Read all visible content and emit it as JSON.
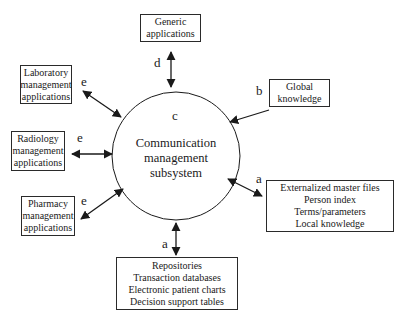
{
  "center": {
    "label": "c",
    "lines": [
      "Communication",
      "management",
      "subsystem"
    ]
  },
  "nodes": {
    "generic": {
      "lines": [
        "Generic",
        "applications"
      ],
      "edge_label": "d"
    },
    "global": {
      "lines": [
        "Global",
        "knowledge"
      ],
      "edge_label": "b"
    },
    "lab": {
      "lines": [
        "Laboratory",
        "management",
        "applications"
      ],
      "edge_label": "e"
    },
    "radiology": {
      "lines": [
        "Radiology",
        "management",
        "applications"
      ],
      "edge_label": "e"
    },
    "pharmacy": {
      "lines": [
        "Pharmacy",
        "management",
        "applications"
      ],
      "edge_label": "e"
    },
    "master_files": {
      "lines": [
        "Externalized master files",
        "Person index",
        "Terms/parameters",
        "Local knowledge"
      ],
      "edge_label": "a"
    },
    "repositories": {
      "lines": [
        "Repositories",
        "Transaction databases",
        "Electronic patient charts",
        "Decision support tables"
      ],
      "edge_label": "a"
    }
  },
  "colors": {
    "stroke": "#1a1a1a",
    "background": "#ffffff"
  }
}
